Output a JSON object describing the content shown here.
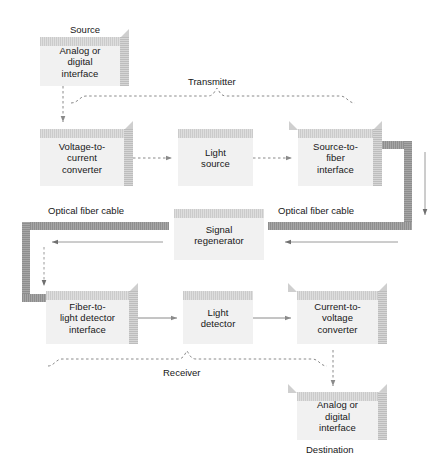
{
  "diagram": {
    "background_color": "#ffffff",
    "box_fill_color": "#f1f1f1",
    "cable_color": "#9a9a9a",
    "text_color": "#171717",
    "boxes": [
      {
        "id": "source-interface",
        "label": "Analog or\ndigital\ninterface"
      },
      {
        "id": "voltage-to-current",
        "label": "Voltage-to-\ncurrent\nconverter"
      },
      {
        "id": "light-source",
        "label": "Light\nsource"
      },
      {
        "id": "source-to-fiber",
        "label": "Source-to-\nfiber\ninterface"
      },
      {
        "id": "signal-regenerator",
        "label": "Signal\nregenerator"
      },
      {
        "id": "fiber-to-light-detector",
        "label": "Fiber-to-\nlight detector\ninterface"
      },
      {
        "id": "light-detector",
        "label": "Light\ndetector"
      },
      {
        "id": "current-to-voltage",
        "label": "Current-to-\nvoltage\nconverter"
      },
      {
        "id": "destination-interface",
        "label": "Analog or\ndigital\ninterface"
      }
    ],
    "captions": [
      {
        "id": "source-caption",
        "label": "Source"
      },
      {
        "id": "transmitter-caption",
        "label": "Transmitter"
      },
      {
        "id": "optical-fiber-left",
        "label": "Optical fiber cable"
      },
      {
        "id": "optical-fiber-right",
        "label": "Optical fiber cable"
      },
      {
        "id": "receiver-caption",
        "label": "Receiver"
      },
      {
        "id": "destination-caption",
        "label": "Destination"
      }
    ]
  }
}
